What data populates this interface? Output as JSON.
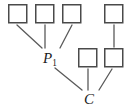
{
  "diagram": {
    "type": "tree",
    "colors": {
      "background": "#ffffff",
      "square_stroke": "#4a4a4a",
      "square_fill": "#ffffff",
      "edge_stroke": "#5a5a5a",
      "label_text": "#1b1b1b"
    },
    "squares": [
      {
        "id": "sq-top-1",
        "x": 8,
        "y": 4,
        "size": 19
      },
      {
        "id": "sq-top-2",
        "x": 35,
        "y": 4,
        "size": 19
      },
      {
        "id": "sq-top-3",
        "x": 62,
        "y": 4,
        "size": 19
      },
      {
        "id": "sq-top-4",
        "x": 104,
        "y": 4,
        "size": 19
      },
      {
        "id": "sq-mid-1",
        "x": 78,
        "y": 48,
        "size": 19
      },
      {
        "id": "sq-mid-2",
        "x": 104,
        "y": 48,
        "size": 19
      }
    ],
    "labels": [
      {
        "id": "label-p1",
        "base": "P",
        "subscript": "1"
      },
      {
        "id": "label-c",
        "base": "C",
        "subscript": ""
      }
    ],
    "edges": [
      {
        "id": "edge-sq-top-1-to-p1",
        "from": "sq-top-1",
        "to": "label-p1",
        "x1": 17,
        "y1": 25,
        "x2": 42,
        "y2": 48
      },
      {
        "id": "edge-sq-top-2-to-p1",
        "from": "sq-top-2",
        "to": "label-p1",
        "x1": 45,
        "y1": 25,
        "x2": 45,
        "y2": 48
      },
      {
        "id": "edge-sq-top-3-to-p1",
        "from": "sq-top-3",
        "to": "label-p1",
        "x1": 72,
        "y1": 25,
        "x2": 60,
        "y2": 48
      },
      {
        "id": "edge-sq-top-4-to-sq-mid-2",
        "from": "sq-top-4",
        "to": "sq-mid-2",
        "x1": 114,
        "y1": 25,
        "x2": 114,
        "y2": 47
      },
      {
        "id": "edge-p1-to-c",
        "from": "label-p1",
        "to": "label-c",
        "x1": 55,
        "y1": 68,
        "x2": 82,
        "y2": 90
      },
      {
        "id": "edge-sq-mid-1-to-c",
        "from": "sq-mid-1",
        "to": "label-c",
        "x1": 88,
        "y1": 69,
        "x2": 88,
        "y2": 90
      },
      {
        "id": "edge-sq-mid-2-to-c",
        "from": "sq-mid-2",
        "to": "label-c",
        "x1": 112,
        "y1": 69,
        "x2": 99,
        "y2": 90
      }
    ]
  }
}
